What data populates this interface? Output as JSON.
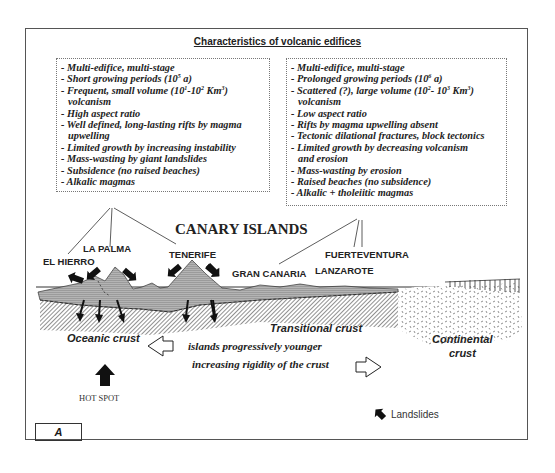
{
  "title": "Characteristics of volcanic edifices",
  "left_box": {
    "lines": [
      {
        "text": "- Multi-edifice, multi-stage"
      },
      {
        "pre": "- Short growing periods (10",
        "sup": "5",
        "post": " a)"
      },
      {
        "pre": "- Frequent, small volume (10",
        "sup": "1",
        "mid": "-10",
        "sup2": "2",
        "post": "  Km",
        "sup3": "3",
        "post2": ")"
      },
      {
        "text": "volcanism",
        "indent": true
      },
      {
        "text": "- High aspect ratio"
      },
      {
        "text": "- Well defined, long-lasting rifts by magma"
      },
      {
        "text": "upwelling",
        "indent": true
      },
      {
        "text": "- Limited growth by increasing instability"
      },
      {
        "text": "- Mass-wasting by giant landslides"
      },
      {
        "text": "- Subsidence (no raised beaches)"
      },
      {
        "text": "- Alkalic magmas"
      }
    ]
  },
  "right_box": {
    "lines": [
      {
        "text": "- Multi-edifice, multi-stage"
      },
      {
        "pre": "- Prolonged growing periods (10",
        "sup": "6",
        "post": " a)"
      },
      {
        "pre": "- Scattered (?), large volume (10",
        "sup": "2",
        "mid": "- 10",
        "sup2": "3",
        "post": " Km",
        "sup3": "3",
        "post2": ")"
      },
      {
        "text": "volcanism",
        "indent": true
      },
      {
        "text": "- Low aspect ratio"
      },
      {
        "text": "- Rifts by magma upwelling absent"
      },
      {
        "text": "- Tectonic dilational fractures, block tectonics"
      },
      {
        "text": "- Limited growth by decreasing volcanism"
      },
      {
        "text": "and erosion",
        "indent": true
      },
      {
        "text": "- Mass-wasting by erosion"
      },
      {
        "text": "- Raised beaches (no subsidence)"
      },
      {
        "text": "- Alkalic + tholeiitic magmas"
      }
    ]
  },
  "region_label": "CANARY ISLANDS",
  "islands": {
    "el_hierro": "EL HIERRO",
    "la_palma": "LA PALMA",
    "tenerife": "TENERIFE",
    "gran_canaria": "GRAN CANARIA",
    "fuerteventura": "FUERTEVENTURA",
    "lanzarote": "LANZAROTE"
  },
  "crust_labels": {
    "oceanic": "Oceanic crust",
    "transitional": "Transitional crust",
    "continental_1": "Continental",
    "continental_2": "crust"
  },
  "notes": {
    "line1": "islands progressively younger",
    "line2": "increasing rigidity of the crust"
  },
  "hotspot_label": "HOT SPOT",
  "legend": {
    "landslides_label": "Landslides",
    "landslides_icon": "landslide-arrow-icon"
  },
  "panel_label": "A",
  "colors": {
    "island_fill": "#a9a9a9",
    "hatch": "#555555",
    "border": "#555555",
    "text": "#222222"
  }
}
